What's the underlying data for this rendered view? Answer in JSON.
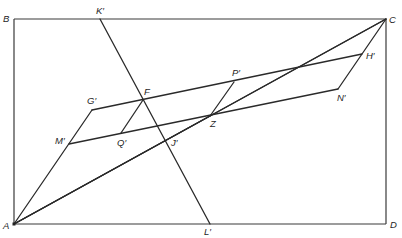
{
  "diagram": {
    "title": "",
    "points": {
      "A": {
        "label": "A"
      },
      "B": {
        "label": "B"
      },
      "C": {
        "label": "C"
      },
      "D": {
        "label": "D"
      },
      "K": {
        "label": "K′"
      },
      "L": {
        "label": "L′"
      },
      "F": {
        "label": "F"
      },
      "G": {
        "label": "G′"
      },
      "H": {
        "label": "H′"
      },
      "M": {
        "label": "M′"
      },
      "N": {
        "label": "N′"
      },
      "P": {
        "label": "P′"
      },
      "Q": {
        "label": "Q′"
      },
      "J": {
        "label": "J′"
      },
      "Z": {
        "label": "Z"
      }
    },
    "segments": [
      {
        "name": "rectangle-ABCD",
        "from": "B",
        "to": "C"
      },
      {
        "name": "line-KL",
        "from": "K",
        "to": "L"
      },
      {
        "name": "line-AC",
        "from": "A",
        "to": "C"
      },
      {
        "name": "line-AJ-Z",
        "from": "A",
        "to": "J"
      },
      {
        "name": "line-GH",
        "from": "G",
        "to": "H"
      },
      {
        "name": "line-MN",
        "from": "M",
        "to": "N"
      },
      {
        "name": "line-AG",
        "from": "A",
        "to": "G"
      },
      {
        "name": "line-CN",
        "from": "C",
        "to": "N"
      },
      {
        "name": "line-FQ",
        "from": "F",
        "to": "Q"
      },
      {
        "name": "line-PZ",
        "from": "P",
        "to": "Z"
      }
    ]
  }
}
